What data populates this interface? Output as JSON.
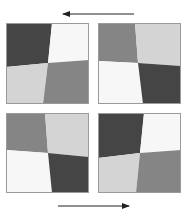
{
  "figure": {
    "colors": {
      "dark": "#454545",
      "medium": "#858585",
      "light": "#d4d4d4",
      "white": "#f7f7f7",
      "border": "#9a9a9a",
      "arrow": "#222222",
      "background": "#ffffff"
    },
    "arrows": [
      {
        "id": "top-arrow",
        "direction": "left"
      },
      {
        "id": "bottom-arrow",
        "direction": "right"
      }
    ],
    "panels": [
      {
        "id": "top-left",
        "quadrants": {
          "top_left": "dark",
          "top_right": "white",
          "bottom_left": "light",
          "bottom_right": "medium"
        }
      },
      {
        "id": "top-right",
        "quadrants": {
          "top_left": "medium",
          "top_right": "light",
          "bottom_left": "white",
          "bottom_right": "dark"
        }
      },
      {
        "id": "bottom-left",
        "quadrants": {
          "top_left": "medium",
          "top_right": "light",
          "bottom_left": "white",
          "bottom_right": "dark"
        }
      },
      {
        "id": "bottom-right",
        "quadrants": {
          "top_left": "dark",
          "top_right": "white",
          "bottom_left": "light",
          "bottom_right": "medium"
        }
      }
    ]
  }
}
